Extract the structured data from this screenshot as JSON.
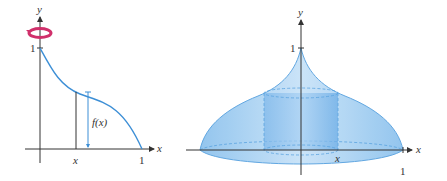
{
  "left_panel": {
    "y_axis_label": "y",
    "x_axis_label": "x",
    "y_tick_label": "1",
    "x_tick_label_one": "1",
    "x_tick_label_x": "x",
    "function_label": "f(x)",
    "rotation_icon": "rotation-arrow-icon"
  },
  "right_panel": {
    "y_axis_label": "y",
    "x_axis_label": "x",
    "y_tick_label": "1",
    "x_tick_label_one": "1",
    "x_tick_label_x": "x"
  },
  "colors": {
    "curve": "#3d8fd6",
    "solid_fill": "#a9d2f3",
    "solid_edge": "#5aa3e0",
    "cylinder": "#8cc0ec",
    "rotation": "#d0306b",
    "axis": "#333333"
  }
}
